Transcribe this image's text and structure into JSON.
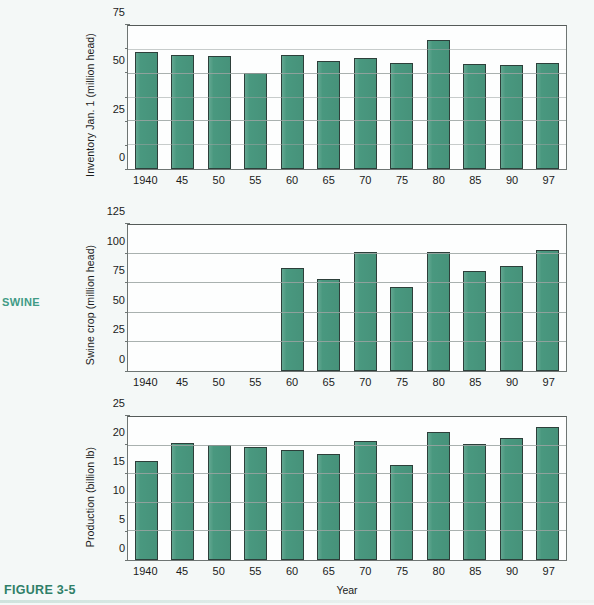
{
  "figure": {
    "side_label": "SWINE",
    "caption": "FIGURE 3-5"
  },
  "chart_data": [
    {
      "type": "bar",
      "title": "",
      "xlabel": "",
      "ylabel": "Inventory Jan. 1 (million head)",
      "categories": [
        "1940",
        "45",
        "50",
        "55",
        "60",
        "65",
        "70",
        "75",
        "80",
        "85",
        "90",
        "97"
      ],
      "values": [
        61.5,
        60.0,
        59.5,
        50.5,
        59.8,
        56.5,
        58.3,
        55.5,
        67.8,
        55.0,
        54.5,
        55.5
      ],
      "ylim": [
        0,
        75
      ],
      "yticks": [
        0,
        25,
        50,
        75
      ],
      "yticklabels": [
        "0",
        "25",
        "50",
        "75"
      ],
      "minor_yticks": [
        12.5,
        37.5,
        62.5
      ],
      "grid": true,
      "legend": "none"
    },
    {
      "type": "bar",
      "title": "",
      "xlabel": "",
      "ylabel": "Swine crop (million head)",
      "categories": [
        "1940",
        "45",
        "50",
        "55",
        "60",
        "65",
        "70",
        "75",
        "80",
        "85",
        "90",
        "97"
      ],
      "values": [
        null,
        null,
        null,
        null,
        88.5,
        78.5,
        102.0,
        72.0,
        102.3,
        86.0,
        90.0,
        104.0
      ],
      "ylim": [
        0,
        125
      ],
      "yticks": [
        0,
        25,
        50,
        75,
        100,
        125
      ],
      "yticklabels": [
        "0",
        "25",
        "50",
        "75",
        "100",
        "125"
      ],
      "minor_yticks": [],
      "grid": true,
      "legend": "none"
    },
    {
      "type": "bar",
      "title": "",
      "xlabel": "Year",
      "ylabel": "Production (billion lb)",
      "categories": [
        "1940",
        "45",
        "50",
        "55",
        "60",
        "65",
        "70",
        "75",
        "80",
        "85",
        "90",
        "97"
      ],
      "values": [
        17.3,
        20.4,
        20.1,
        19.8,
        19.3,
        18.5,
        20.8,
        16.6,
        22.3,
        20.3,
        21.4,
        23.3
      ],
      "ylim": [
        0,
        25
      ],
      "yticks": [
        0,
        5,
        10,
        15,
        20,
        25
      ],
      "yticklabels": [
        "0",
        "5",
        "10",
        "15",
        "20",
        "25"
      ],
      "minor_yticks": [],
      "grid": true,
      "legend": "none"
    }
  ],
  "colors": {
    "bar_fill": "#49987f",
    "bar_edge": "#2d3f3a",
    "accent": "#3f9b86",
    "caption": "#2f7f68",
    "page_background": "#f4f8f7",
    "plot_background": "#fdfefe",
    "gridline": "#9aa3a1"
  }
}
